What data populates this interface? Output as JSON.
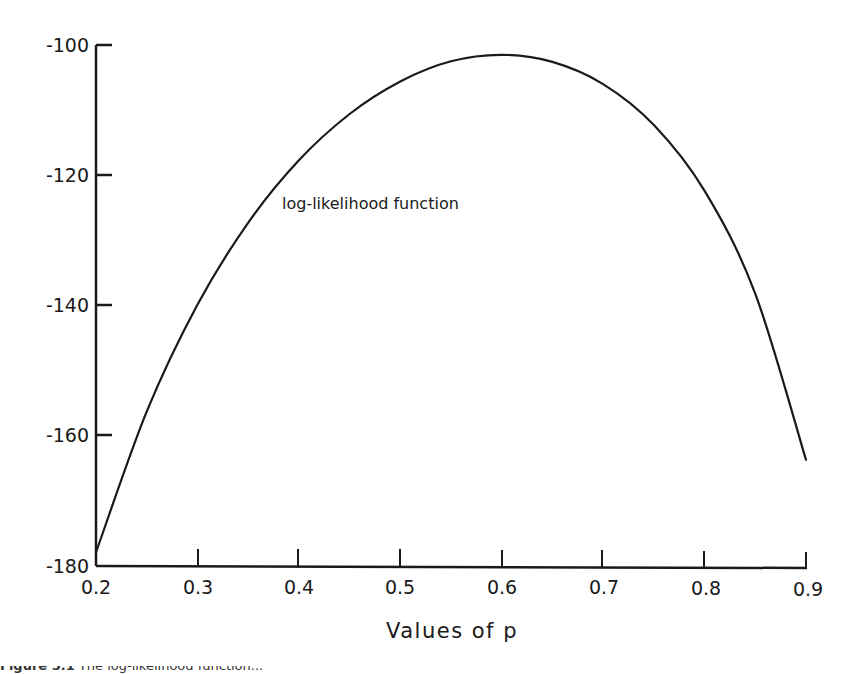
{
  "chart_data": {
    "type": "line",
    "title": "",
    "xlabel": "Values of p",
    "ylabel": "",
    "xlim": [
      0.2,
      0.9
    ],
    "ylim": [
      -180,
      -100
    ],
    "grid": false,
    "legend": null,
    "x_ticks": [
      "0.2",
      "0.3",
      "0.4",
      "0.5",
      "0.6",
      "0.7",
      "0.8",
      "0.9"
    ],
    "y_ticks": [
      "-100",
      "-120",
      "-140",
      "-160",
      "-180"
    ],
    "annotations": [
      {
        "text": "log-likelihood function",
        "x": 0.43,
        "y": -121
      }
    ],
    "series": [
      {
        "name": "log-likelihood function",
        "x": [
          0.2,
          0.25,
          0.3,
          0.35,
          0.4,
          0.45,
          0.5,
          0.55,
          0.6,
          0.65,
          0.7,
          0.75,
          0.8,
          0.85,
          0.9
        ],
        "y": [
          -177.9,
          -156.3,
          -139.9,
          -127.3,
          -117.7,
          -110.6,
          -105.6,
          -102.5,
          -101.5,
          -102.6,
          -106.0,
          -112.3,
          -122.4,
          -138.2,
          -163.7
        ]
      }
    ]
  },
  "axis": {
    "x_title": "Values of p",
    "x_tick_labels": [
      "0.2",
      "0.3",
      "0.4",
      "0.5",
      "0.6",
      "0.7",
      "0.8",
      "0.9"
    ],
    "y_tick_labels": [
      "-100",
      "-120",
      "-140",
      "-160",
      "-180"
    ]
  },
  "annotation": {
    "curve_label": "log-likelihood function"
  },
  "caption": {
    "prefix": "Figure 5.1",
    "text": "  The log-likelihood function..."
  },
  "colors": {
    "line": "#1a1a1a",
    "background": "#ffffff"
  }
}
